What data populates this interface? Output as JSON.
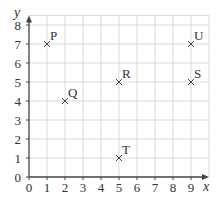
{
  "chart_data": {
    "type": "scatter",
    "title": "",
    "xlabel": "x",
    "ylabel": "y",
    "xlim": [
      0,
      10
    ],
    "ylim": [
      0,
      8.5
    ],
    "grid": true,
    "x_ticks": [
      "0",
      "1",
      "2",
      "3",
      "4",
      "5",
      "6",
      "7",
      "8",
      "9"
    ],
    "y_ticks": [
      "0",
      "1",
      "2",
      "3",
      "4",
      "5",
      "6",
      "7",
      "8"
    ],
    "marker": "x",
    "points": [
      {
        "label": "P",
        "x": 1,
        "y": 7
      },
      {
        "label": "Q",
        "x": 2,
        "y": 4
      },
      {
        "label": "R",
        "x": 5,
        "y": 5
      },
      {
        "label": "S",
        "x": 9,
        "y": 5
      },
      {
        "label": "T",
        "x": 5,
        "y": 1
      },
      {
        "label": "U",
        "x": 9,
        "y": 7
      }
    ]
  },
  "colors": {
    "axis": "#444444",
    "grid": "#d9d9d9",
    "marker": "#444444",
    "text": "#333333"
  }
}
